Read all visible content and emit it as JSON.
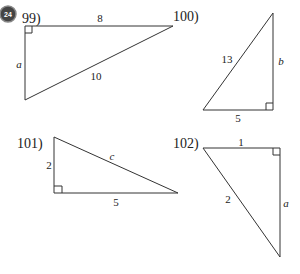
{
  "badge": {
    "label": "24",
    "color": "#444444"
  },
  "problems": [
    {
      "number": "99)",
      "sides": {
        "top": "8",
        "left": "a",
        "hypotenuse": "10"
      },
      "right_angle": "top-left"
    },
    {
      "number": "100)",
      "sides": {
        "hypotenuse": "13",
        "right": "b",
        "bottom": "5"
      },
      "right_angle": "bottom-right"
    },
    {
      "number": "101)",
      "sides": {
        "left": "2",
        "hypotenuse": "c",
        "bottom": "5"
      },
      "right_angle": "bottom-left"
    },
    {
      "number": "102)",
      "sides": {
        "top": "1",
        "hypotenuse": "2",
        "right": "a"
      },
      "right_angle": "top-right"
    }
  ]
}
